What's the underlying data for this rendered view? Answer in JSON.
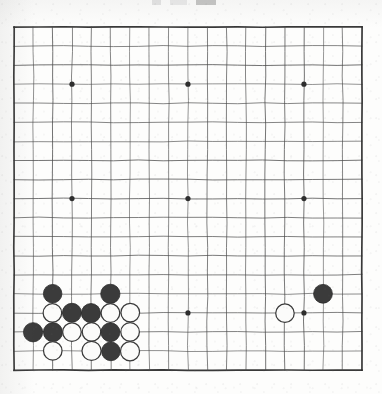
{
  "document": {
    "kind": "go-board-diagram",
    "title": "Go board position diagram",
    "paper_color": "#fdfdfc",
    "ink_color": "#3a3a3a"
  },
  "artifact": {
    "name": "scan-edge-mark",
    "description": "cropped dark mark at top edge of scan"
  },
  "board": {
    "size": 19,
    "columns": 19,
    "rows": 19,
    "origin_x": 14,
    "origin_y": 27,
    "spacing_x": 19.33,
    "spacing_y": 19.06,
    "line_color": "#4a4a4a",
    "border_color": "#2e2e2e",
    "line_width": 0.9,
    "border_width": 1.7,
    "star_points": [
      {
        "col": 4,
        "row": 4
      },
      {
        "col": 10,
        "row": 4
      },
      {
        "col": 16,
        "row": 4
      },
      {
        "col": 4,
        "row": 10
      },
      {
        "col": 10,
        "row": 10
      },
      {
        "col": 16,
        "row": 10
      },
      {
        "col": 4,
        "row": 16
      },
      {
        "col": 10,
        "row": 16
      },
      {
        "col": 16,
        "row": 16
      }
    ],
    "star_radius": 2.6,
    "stone_radius": 9.4,
    "black_color": "#3b3b3b",
    "white_color": "#fbfbfa",
    "white_edge_color": "#3a3a3a",
    "stones": [
      {
        "col": 3,
        "row": 15,
        "color": "black"
      },
      {
        "col": 6,
        "row": 15,
        "color": "black"
      },
      {
        "col": 17,
        "row": 15,
        "color": "black"
      },
      {
        "col": 3,
        "row": 16,
        "color": "white"
      },
      {
        "col": 4,
        "row": 16,
        "color": "black"
      },
      {
        "col": 5,
        "row": 16,
        "color": "black"
      },
      {
        "col": 6,
        "row": 16,
        "color": "white"
      },
      {
        "col": 7,
        "row": 16,
        "color": "white"
      },
      {
        "col": 15,
        "row": 16,
        "color": "white"
      },
      {
        "col": 2,
        "row": 17,
        "color": "black"
      },
      {
        "col": 3,
        "row": 17,
        "color": "black"
      },
      {
        "col": 4,
        "row": 17,
        "color": "white"
      },
      {
        "col": 5,
        "row": 17,
        "color": "white"
      },
      {
        "col": 6,
        "row": 17,
        "color": "black"
      },
      {
        "col": 7,
        "row": 17,
        "color": "white"
      },
      {
        "col": 3,
        "row": 18,
        "color": "white"
      },
      {
        "col": 5,
        "row": 18,
        "color": "white"
      },
      {
        "col": 6,
        "row": 18,
        "color": "black"
      },
      {
        "col": 7,
        "row": 18,
        "color": "white"
      }
    ],
    "stone_counts": {
      "black": 9,
      "white": 10,
      "total": 19
    }
  }
}
